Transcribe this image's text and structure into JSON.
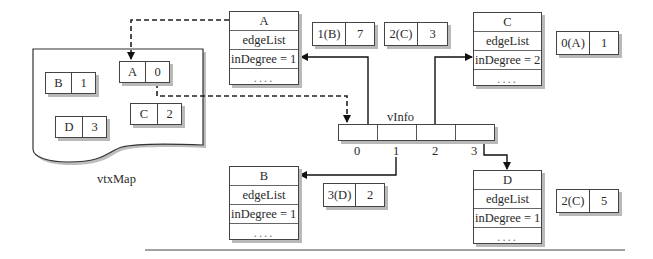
{
  "diagram": {
    "vtxMap": {
      "label": "vtxMap",
      "entries": [
        {
          "key": "A",
          "value": "0"
        },
        {
          "key": "B",
          "value": "1"
        },
        {
          "key": "C",
          "value": "2"
        },
        {
          "key": "D",
          "value": "3"
        }
      ]
    },
    "vInfo": {
      "label": "vInfo",
      "indices": [
        "0",
        "1",
        "2",
        "3"
      ]
    },
    "vertices": [
      {
        "name": "A",
        "edge_list": "edgeList",
        "in_degree": "inDegree = 1",
        "more": "...."
      },
      {
        "name": "B",
        "edge_list": "edgeList",
        "in_degree": "inDegree = 1",
        "more": "...."
      },
      {
        "name": "C",
        "edge_list": "edgeList",
        "in_degree": "inDegree = 2",
        "more": "...."
      },
      {
        "name": "D",
        "edge_list": "edgeList",
        "in_degree": "inDegree = 1",
        "more": "...."
      }
    ],
    "edges": {
      "A": [
        {
          "dest": "1(B)",
          "weight": "7"
        },
        {
          "dest": "2(C)",
          "weight": "3"
        }
      ],
      "B": [
        {
          "dest": "3(D)",
          "weight": "2"
        }
      ],
      "C": [
        {
          "dest": "0(A)",
          "weight": "1"
        }
      ],
      "D": [
        {
          "dest": "2(C)",
          "weight": "5"
        }
      ]
    }
  }
}
